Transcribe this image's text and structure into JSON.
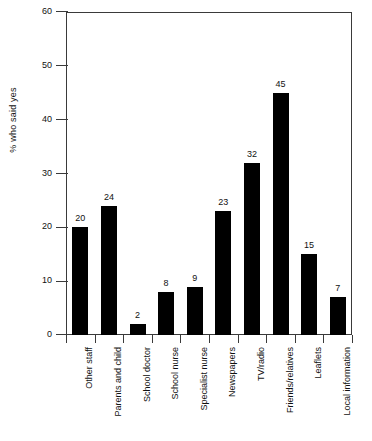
{
  "chart_data": {
    "type": "bar",
    "title": "",
    "subtitle": "",
    "xlabel": "",
    "ylabel": "% who said yes",
    "ylim": [
      0,
      60
    ],
    "yticks": [
      0,
      10,
      20,
      30,
      40,
      50,
      60
    ],
    "grid": false,
    "legend": "none",
    "orientation": "vertical",
    "bar_color": "#000000",
    "axis_color": "#3a3a3a",
    "background": "#ffffff",
    "value_labels": true,
    "categories": [
      "Other staff",
      "Parents and child",
      "School doctor",
      "School nurse",
      "Specialist nurse",
      "Newspapers",
      "TV/radio",
      "Friends/relatives",
      "Leaflets",
      "Local information"
    ],
    "values": [
      20,
      24,
      2,
      8,
      9,
      23,
      32,
      45,
      15,
      7
    ]
  },
  "axis": {
    "y_title": "% who said yes",
    "tick_labels": [
      "0",
      "10",
      "20",
      "30",
      "40",
      "50",
      "60"
    ]
  }
}
